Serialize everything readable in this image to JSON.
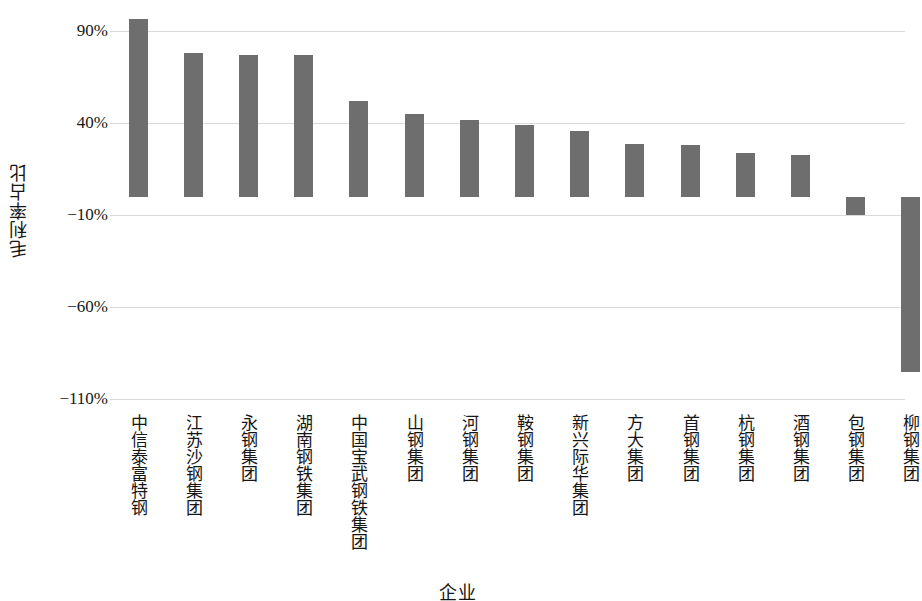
{
  "chart_data": {
    "type": "bar",
    "title": "",
    "xlabel": "企业",
    "ylabel": "毛利率占比",
    "categories": [
      "中信泰富特钢",
      "江苏沙钢集团",
      "永钢集团",
      "湖南钢铁集团",
      "中国宝武钢铁集团",
      "山钢集团",
      "河钢集团",
      "鞍钢集团",
      "新兴际华集团",
      "方大集团",
      "首钢集团",
      "杭钢集团",
      "酒钢集团",
      "包钢集团",
      "柳钢集团"
    ],
    "values": [
      97,
      78,
      77,
      77,
      52,
      45,
      42,
      39,
      36,
      29,
      28,
      24,
      23,
      -10,
      -95
    ],
    "ytick_labels": [
      "90%",
      "40%",
      "−10%",
      "−60%",
      "−110%"
    ],
    "ytick_values": [
      90,
      40,
      -10,
      -60,
      -110
    ],
    "ylim": [
      -120,
      105
    ],
    "grid": true,
    "legend": false,
    "bar_color": "#6e6e6e",
    "grid_color": "#d9d9d9",
    "background": "#ffffff"
  }
}
